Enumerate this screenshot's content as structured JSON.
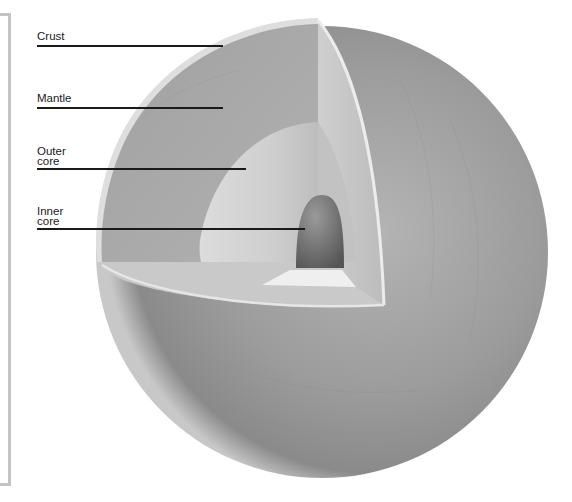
{
  "diagram": {
    "labels": [
      {
        "id": "crust",
        "line1": "Crust",
        "line2": ""
      },
      {
        "id": "mantle",
        "line1": "Mantle",
        "line2": ""
      },
      {
        "id": "outer-core",
        "line1": "Outer",
        "line2": "core"
      },
      {
        "id": "inner-core",
        "line1": "Inner",
        "line2": "core"
      }
    ]
  },
  "colors": {
    "bracket": "#c4c4c4",
    "text": "#1a1a1a",
    "surface": "#9a9a9a",
    "mantle_cut": "#a8a8a8",
    "outer_core": "#d8d8d8",
    "inner_core": "#6e6e6e"
  }
}
